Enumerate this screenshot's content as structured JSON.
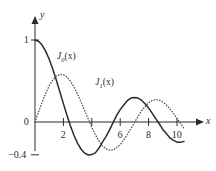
{
  "chart_data": {
    "type": "line",
    "title": "",
    "subtitle": "",
    "xlabel": "x",
    "ylabel": "y",
    "xlim": [
      -0.35,
      11.2
    ],
    "ylim": [
      -0.55,
      1.15
    ],
    "grid": false,
    "legend_position": "inline-annotations",
    "x_ticks": [
      {
        "value": 2,
        "label": "2"
      },
      {
        "value": 4,
        "label": ""
      },
      {
        "value": 6,
        "label": "6"
      },
      {
        "value": 8,
        "label": "8"
      },
      {
        "value": 10,
        "label": "10"
      }
    ],
    "y_ticks": [
      {
        "value": 1,
        "label": "1"
      },
      {
        "value": 0,
        "label": "0"
      },
      {
        "value": -0.4,
        "label": "−0.4"
      }
    ],
    "annotations": [
      {
        "text": "J",
        "sub": "0",
        "suffix": "(x)",
        "x": 1.55,
        "y": 0.78
      },
      {
        "text": "J",
        "sub": "1",
        "suffix": "(x)",
        "x": 4.25,
        "y": 0.46
      }
    ],
    "series": [
      {
        "name": "J0(x)",
        "style": "solid",
        "color": "#2b2b2b",
        "x": [
          0,
          0.25,
          0.5,
          0.75,
          1,
          1.25,
          1.5,
          1.75,
          2,
          2.25,
          2.5,
          2.75,
          3,
          3.25,
          3.5,
          3.75,
          4,
          4.25,
          4.5,
          4.75,
          5,
          5.25,
          5.5,
          5.75,
          6,
          6.25,
          6.5,
          6.75,
          7,
          7.25,
          7.5,
          7.75,
          8,
          8.25,
          8.5,
          8.75,
          9,
          9.25,
          9.5,
          9.75,
          10,
          10.25,
          10.5
        ],
        "y": [
          1.0,
          0.9844,
          0.9385,
          0.8642,
          0.7652,
          0.6459,
          0.5118,
          0.369,
          0.2239,
          0.0827,
          -0.0484,
          -0.1641,
          -0.2601,
          -0.3325,
          -0.3801,
          -0.4026,
          -0.3971,
          -0.3766,
          -0.3205,
          -0.2459,
          -0.1776,
          -0.0968,
          -0.0068,
          0.0802,
          0.1506,
          0.2077,
          0.2601,
          0.2921,
          0.3001,
          0.2919,
          0.2663,
          0.2218,
          0.1717,
          0.1079,
          0.0419,
          -0.0212,
          -0.0903,
          -0.1401,
          -0.1939,
          -0.2243,
          -0.2459,
          -0.2484,
          -0.2366
        ]
      },
      {
        "name": "J1(x)",
        "style": "dotted",
        "color": "#555555",
        "x": [
          0,
          0.25,
          0.5,
          0.75,
          1,
          1.25,
          1.5,
          1.75,
          2,
          2.25,
          2.5,
          2.75,
          3,
          3.25,
          3.5,
          3.75,
          4,
          4.25,
          4.5,
          4.75,
          5,
          5.25,
          5.5,
          5.75,
          6,
          6.25,
          6.5,
          6.75,
          7,
          7.25,
          7.5,
          7.75,
          8,
          8.25,
          8.5,
          8.75,
          9,
          9.25,
          9.5,
          9.75,
          10,
          10.25,
          10.5
        ],
        "y": [
          0.0,
          0.124,
          0.2423,
          0.3492,
          0.4401,
          0.5106,
          0.5579,
          0.5802,
          0.5767,
          0.5484,
          0.4971,
          0.4258,
          0.3391,
          0.2412,
          0.1374,
          0.0366,
          -0.066,
          -0.1538,
          -0.2311,
          -0.2919,
          -0.3276,
          -0.3432,
          -0.3414,
          -0.311,
          -0.2767,
          -0.2196,
          -0.1538,
          -0.0826,
          -0.0047,
          0.0626,
          0.1352,
          0.1894,
          0.2346,
          0.263,
          0.2731,
          0.2664,
          0.2453,
          0.2079,
          0.1613,
          0.1047,
          0.0435,
          -0.0184,
          -0.0789
        ]
      }
    ]
  },
  "axes": {
    "x_axis_name": "x",
    "y_axis_name": "y",
    "origin_label": "0"
  }
}
